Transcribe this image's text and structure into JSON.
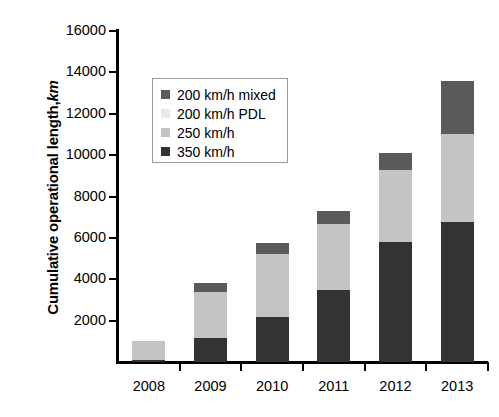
{
  "chart_data": {
    "type": "bar",
    "stacked": true,
    "title": "",
    "xlabel": "",
    "ylabel": "Cumulative operational length, km",
    "ylabel_main": "Cumulative operational length,",
    "ylabel_unit": "km",
    "categories": [
      "2008",
      "2009",
      "2010",
      "2011",
      "2012",
      "2013"
    ],
    "ylim": [
      0,
      16000
    ],
    "ytick_values": [
      0,
      2000,
      4000,
      6000,
      8000,
      10000,
      12000,
      14000,
      16000
    ],
    "ytick_labels": [
      "",
      "2000",
      "4000",
      "6000",
      "8000",
      "10000",
      "12000",
      "14000",
      "16000"
    ],
    "grid": false,
    "legend_position": "upper-left-inside",
    "series": [
      {
        "name": "350 km/h",
        "color": "#333333",
        "stack_order": 0,
        "values": [
          120,
          1150,
          2200,
          3500,
          5800,
          6750
        ]
      },
      {
        "name": "250 km/h",
        "color": "#c4c4c4",
        "stack_order": 1,
        "values": [
          880,
          2250,
          3000,
          3150,
          3500,
          4250
        ]
      },
      {
        "name": "200 km/h PDL",
        "color": "#e8e8e8",
        "stack_order": 2,
        "values": [
          0,
          0,
          0,
          0,
          0,
          0
        ]
      },
      {
        "name": "200 km/h mixed",
        "color": "#5a5a5a",
        "stack_order": 3,
        "values": [
          0,
          400,
          550,
          650,
          800,
          2600
        ]
      }
    ],
    "totals": [
      1000,
      3800,
      5750,
      7300,
      10100,
      13600
    ]
  },
  "legend": {
    "items": [
      {
        "label": "200 km/h mixed",
        "color": "#5a5a5a"
      },
      {
        "label": "200 km/h PDL",
        "color": "#e8e8e8"
      },
      {
        "label": "250 km/h",
        "color": "#c4c4c4"
      },
      {
        "label": "350 km/h",
        "color": "#333333"
      }
    ]
  },
  "colors": {
    "axis": "#000000",
    "background": "#ffffff",
    "legend_border": "#9a9a9a"
  }
}
